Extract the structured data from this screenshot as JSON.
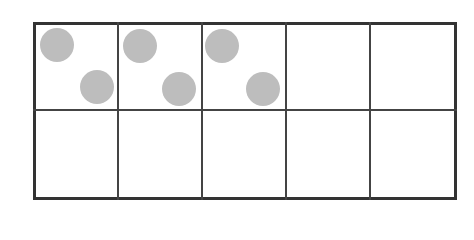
{
  "diagram": {
    "type": "ten-frame",
    "rows": 2,
    "columns": 5,
    "counters": {
      "count": 6,
      "color": "#bdbdbd",
      "positions": [
        {
          "cell": 1,
          "slot": "top-left"
        },
        {
          "cell": 1,
          "slot": "bottom-right"
        },
        {
          "cell": 2,
          "slot": "top-left"
        },
        {
          "cell": 2,
          "slot": "bottom-right"
        },
        {
          "cell": 3,
          "slot": "top-left"
        },
        {
          "cell": 3,
          "slot": "bottom-right"
        }
      ]
    },
    "grid_color": "#333333"
  }
}
